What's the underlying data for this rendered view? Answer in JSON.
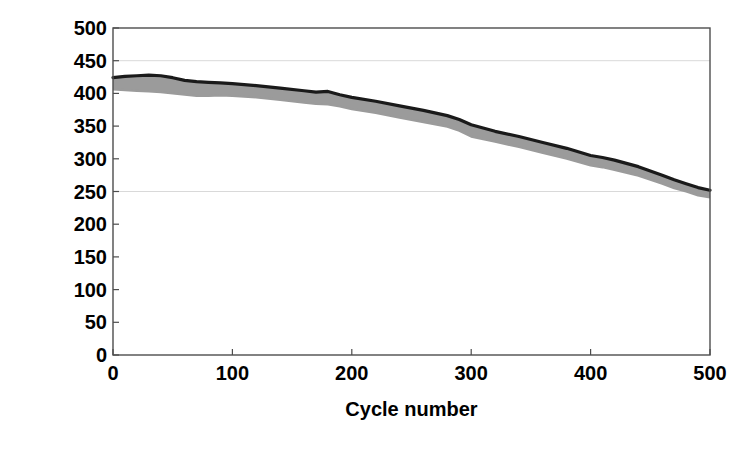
{
  "chart_data": {
    "type": "area",
    "title": "",
    "subtitle": "",
    "xlabel": "Cycle number",
    "ylabel_text": "Energy density/mA·h g",
    "ylabel_exponent": "-1",
    "xlim": [
      0,
      500
    ],
    "ylim": [
      0,
      500
    ],
    "xticks": [
      0,
      100,
      200,
      300,
      400,
      500
    ],
    "yticks": [
      0,
      50,
      100,
      150,
      200,
      250,
      300,
      350,
      400,
      450,
      500
    ],
    "xtick_labels": [
      "0",
      "100",
      "200",
      "300",
      "400",
      "500"
    ],
    "ytick_labels": [
      "0",
      "50",
      "100",
      "150",
      "200",
      "250",
      "300",
      "350",
      "400",
      "450",
      "500"
    ],
    "grid": "horizontal-faint",
    "gridlines_at": [
      250,
      450
    ],
    "legend": "none",
    "annotations": [],
    "series": [
      {
        "name": "upper-envelope-dark",
        "color": "#1a1a1a",
        "x": [
          0,
          10,
          20,
          30,
          40,
          50,
          60,
          70,
          80,
          90,
          100,
          120,
          140,
          160,
          170,
          180,
          190,
          200,
          220,
          240,
          260,
          280,
          290,
          300,
          320,
          340,
          360,
          380,
          400,
          410,
          420,
          440,
          460,
          470,
          480,
          490,
          500
        ],
        "values": [
          424,
          426,
          427,
          428,
          427,
          424,
          420,
          418,
          417,
          416,
          415,
          412,
          408,
          404,
          402,
          403,
          398,
          394,
          388,
          381,
          374,
          366,
          360,
          352,
          342,
          334,
          325,
          316,
          305,
          302,
          298,
          288,
          275,
          268,
          262,
          256,
          252
        ]
      },
      {
        "name": "lower-envelope-gray",
        "color": "#9b9b9b",
        "x": [
          0,
          10,
          20,
          30,
          40,
          50,
          60,
          70,
          80,
          90,
          100,
          120,
          140,
          160,
          170,
          180,
          190,
          200,
          220,
          240,
          260,
          280,
          290,
          300,
          320,
          340,
          360,
          380,
          400,
          410,
          420,
          440,
          460,
          470,
          480,
          490,
          500
        ],
        "values": [
          406,
          405,
          404,
          403,
          402,
          400,
          398,
          396,
          396,
          397,
          396,
          394,
          390,
          386,
          384,
          383,
          380,
          376,
          370,
          363,
          356,
          349,
          343,
          334,
          326,
          318,
          309,
          300,
          290,
          287,
          283,
          274,
          262,
          255,
          250,
          244,
          241
        ]
      }
    ],
    "band": {
      "name": "energy-density-band",
      "fill_color": "#9b9b9b",
      "edge_color": "#1a1a1a",
      "start_value": 415,
      "end_value": 247,
      "description": "Energy density decays from about 415 to about 247 mA·h per gram over 500 cycles"
    }
  },
  "axes": {
    "frame_color": "#4d4d4d",
    "grid_color": "#d9d9d9",
    "tick_color": "#4d4d4d"
  }
}
